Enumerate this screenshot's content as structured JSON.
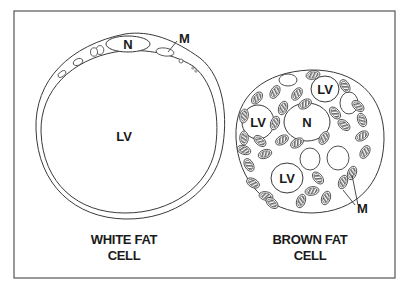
{
  "diagram": {
    "type": "cell-comparison-illustration",
    "colors": {
      "stroke": "#3a3a3a",
      "frame": "#555555",
      "mito_fill": "#7a7a7a",
      "background": "#ffffff",
      "text": "#1a1a1a"
    },
    "white_fat_cell": {
      "caption_line1": "WHITE FAT",
      "caption_line2": "CELL",
      "labels": {
        "nucleus": "N",
        "lipid_vacuole": "LV",
        "mitochondrion": "M"
      }
    },
    "brown_fat_cell": {
      "caption_line1": "BROWN FAT",
      "caption_line2": "CELL",
      "labels": {
        "nucleus": "N",
        "lipid_vacuole_1": "LV",
        "lipid_vacuole_2": "LV",
        "lipid_vacuole_3": "LV",
        "mitochondrion": "M"
      }
    }
  }
}
